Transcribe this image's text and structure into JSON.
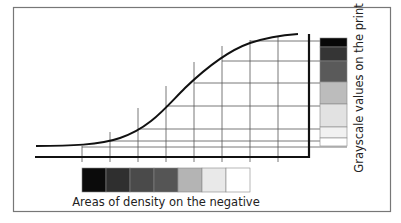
{
  "diagram": {
    "x_label": "Areas of density on the negative",
    "y_label": "Grayscale values on the print",
    "negative_swatches": [
      "#0b0b0b",
      "#2f2f2f",
      "#4a4a4a",
      "#555555",
      "#b4b4b4",
      "#e9e9e9",
      "#ffffff"
    ],
    "print_swatches": [
      {
        "color": "#070707",
        "height": 9
      },
      {
        "color": "#353535",
        "height": 14
      },
      {
        "color": "#5a5a5a",
        "height": 21
      },
      {
        "color": "#bcbcbc",
        "height": 22
      },
      {
        "color": "#e2e2e2",
        "height": 23
      },
      {
        "color": "#f1f1f1",
        "height": 11
      },
      {
        "color": "#ffffff",
        "height": 8
      }
    ],
    "colors": {
      "frame": "#777777",
      "axis": "#111111",
      "grid": "#555555",
      "curve": "#111111"
    }
  }
}
